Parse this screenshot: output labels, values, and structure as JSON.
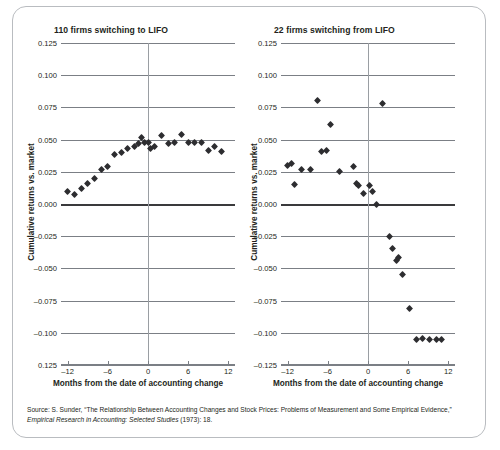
{
  "source_note": {
    "prefix": "Source: S. Sunder, “The Relationship Between Accounting Changes and Stock Prices: Problems of Measurement and Some Empirical Evidence,” ",
    "italic": "Empirical Research in Accounting: Selected Studies",
    "suffix": " (1973): 18."
  },
  "chart_data": [
    {
      "type": "scatter",
      "title": "110 firms switching to LIFO",
      "xlabel": "Months from the date of accounting change",
      "ylabel": "Cumulative returns vs. market",
      "xlim": [
        -13,
        13
      ],
      "ylim": [
        -0.125,
        0.125
      ],
      "xticks": [
        -12,
        -6,
        0,
        6,
        12
      ],
      "xtick_labels": [
        "–12",
        "–6",
        "0",
        "6",
        "12"
      ],
      "yticks": [
        0.125,
        0.1,
        0.075,
        0.05,
        0.025,
        0.0,
        -0.025,
        -0.05,
        -0.075,
        -0.1,
        -0.125
      ],
      "ytick_labels": [
        "0.125",
        "0.100",
        "0.075",
        "0.050",
        "0.025",
        "0.000",
        "–0.025",
        "–0.050",
        "–0.075",
        "–0.100",
        "0.125"
      ],
      "grid": true,
      "zero_line": 0.0,
      "vertical_reference_x": 0,
      "x": [
        -12,
        -11,
        -10,
        -9,
        -8,
        -7,
        -6,
        -5,
        -4,
        -3,
        -2,
        -1.4,
        -1,
        -0.5,
        0,
        0.4,
        1,
        2,
        3,
        4,
        5,
        6,
        7,
        8,
        9,
        10,
        11
      ],
      "y": [
        0.0095,
        0.0073,
        0.0118,
        0.016,
        0.02,
        0.0265,
        0.0288,
        0.0388,
        0.04,
        0.0428,
        0.0448,
        0.047,
        0.052,
        0.048,
        0.048,
        0.043,
        0.0443,
        0.0533,
        0.0473,
        0.0475,
        0.0543,
        0.0475,
        0.0476,
        0.0475,
        0.0418,
        0.0445,
        0.0405
      ]
    },
    {
      "type": "scatter",
      "title": "22 firms switching from LIFO",
      "xlabel": "Months from the date of accounting change",
      "ylabel": "Cumulative returns vs. market",
      "xlim": [
        -13,
        13
      ],
      "ylim": [
        -0.125,
        0.125
      ],
      "xticks": [
        -12,
        -6,
        0,
        6,
        12
      ],
      "xtick_labels": [
        "–12",
        "–6",
        "0",
        "6",
        "12"
      ],
      "yticks": [
        0.125,
        0.1,
        0.075,
        0.05,
        0.025,
        0.0,
        -0.025,
        -0.05,
        -0.075,
        -0.1,
        -0.125
      ],
      "ytick_labels": [
        "0.125",
        "0.100",
        "0.075",
        "0.050",
        "0.025",
        "0.000",
        "–0.025",
        "–0.050",
        "–0.075",
        "–0.100",
        "–0.125"
      ],
      "grid": true,
      "zero_line": 0.0,
      "vertical_reference_x": 0,
      "x": [
        -12,
        -11.5,
        -11,
        -10,
        -8.6,
        -7.6,
        -7,
        -6.2,
        -5.6,
        -4.3,
        -2.2,
        -1.7,
        -1.4,
        -0.7,
        0.2,
        0.7,
        1.3,
        2.2,
        3.2,
        3.6,
        4.2,
        4.6,
        5.2,
        6.2,
        7.2,
        8.2,
        9.2,
        10.2,
        11.0
      ],
      "y": [
        0.03,
        0.0313,
        0.015,
        0.0268,
        0.0265,
        0.08,
        0.0405,
        0.0415,
        0.062,
        0.0255,
        0.0288,
        0.0163,
        0.0143,
        0.0082,
        0.014,
        0.0095,
        0.0,
        0.0778,
        -0.025,
        -0.0348,
        -0.044,
        -0.0412,
        -0.0548,
        -0.0813,
        -0.1055,
        -0.1048,
        -0.105,
        -0.1052,
        -0.105
      ]
    }
  ]
}
